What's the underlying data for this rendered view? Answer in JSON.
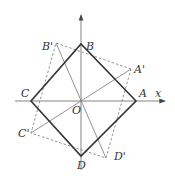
{
  "diagram": {
    "type": "geometry-rotation",
    "axes": {
      "x_label": "x",
      "origin_label": "O",
      "origin": [
        81,
        101
      ]
    },
    "points": {
      "A": {
        "label": "A",
        "xy": [
          136,
          101
        ]
      },
      "B": {
        "label": "B",
        "xy": [
          81,
          44
        ]
      },
      "C": {
        "label": "C",
        "xy": [
          31,
          101
        ]
      },
      "D": {
        "label": "D",
        "xy": [
          81,
          156
        ]
      },
      "A_prime": {
        "label": "A'",
        "xy": [
          131,
          69
        ]
      },
      "B_prime": {
        "label": "B'",
        "xy": [
          56,
          43
        ]
      },
      "C_prime": {
        "label": "C'",
        "xy": [
          31,
          133
        ]
      },
      "D_prime": {
        "label": "D'",
        "xy": [
          106,
          158
        ]
      }
    },
    "colors": {
      "square": "#333333",
      "rotated_square": "#666666",
      "axes": "#555555",
      "diagonals": "#777777"
    }
  }
}
